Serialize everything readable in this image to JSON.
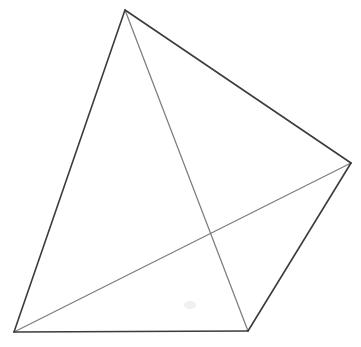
{
  "figure": {
    "background_color": "#ffffff",
    "width": 361,
    "height": 347,
    "outer_edge_color": "#3c3c3c",
    "inner_edge_color": "#7d7d7d",
    "outer_edge_width": 1.6,
    "inner_edge_width": 1.25
  },
  "chart_data": {
    "type": "scatter",
    "subtitle": "",
    "xlabel": "",
    "ylabel": "",
    "xlim": [
      0,
      361
    ],
    "ylim": [
      0,
      347
    ],
    "grid": false,
    "legend": "none",
    "vertices": [
      {
        "id": "A",
        "name": "apex",
        "x": 125,
        "y": 10
      },
      {
        "id": "B",
        "name": "right",
        "x": 351,
        "y": 163
      },
      {
        "id": "C",
        "name": "bottom-right",
        "x": 248,
        "y": 331
      },
      {
        "id": "D",
        "name": "bottom-left",
        "x": 14,
        "y": 332
      }
    ],
    "edges": [
      {
        "id": "AD",
        "from": "A",
        "to": "D",
        "style": "outer",
        "color": "#3c3c3c",
        "width": 1.6
      },
      {
        "id": "AB",
        "from": "A",
        "to": "B",
        "style": "outer",
        "color": "#3c3c3c",
        "width": 1.6
      },
      {
        "id": "BC",
        "from": "B",
        "to": "C",
        "style": "outer",
        "color": "#3c3c3c",
        "width": 1.6
      },
      {
        "id": "CD",
        "from": "C",
        "to": "D",
        "style": "outer",
        "color": "#3c3c3c",
        "width": 1.6
      },
      {
        "id": "AC",
        "from": "A",
        "to": "C",
        "style": "inner",
        "color": "#7d7d7d",
        "width": 1.25
      },
      {
        "id": "DB",
        "from": "D",
        "to": "B",
        "style": "inner",
        "color": "#7d7d7d",
        "width": 1.25
      }
    ],
    "annotations": [
      {
        "name": "diagonal-crossing",
        "x": 207,
        "y": 235,
        "label": ""
      },
      {
        "name": "faint-smudge",
        "x": 190,
        "y": 305,
        "label": ""
      }
    ]
  },
  "paths": {
    "outer_silhouette": "M 125 10 L 14 332 L 248 331 L 351 163 Z",
    "edge_apex_bottomleft": "M 125 10 L 14 332",
    "edge_apex_right": "M 125 10 L 351 163",
    "edge_right_bottomright": "M 351 163 L 248 331",
    "edge_bottomright_bottomleft": "M 248 331 L 14 332",
    "edge_apex_bottomright": "M 125 10 L 248 331",
    "edge_bottomleft_right": "M 14 332 L 351 163"
  }
}
